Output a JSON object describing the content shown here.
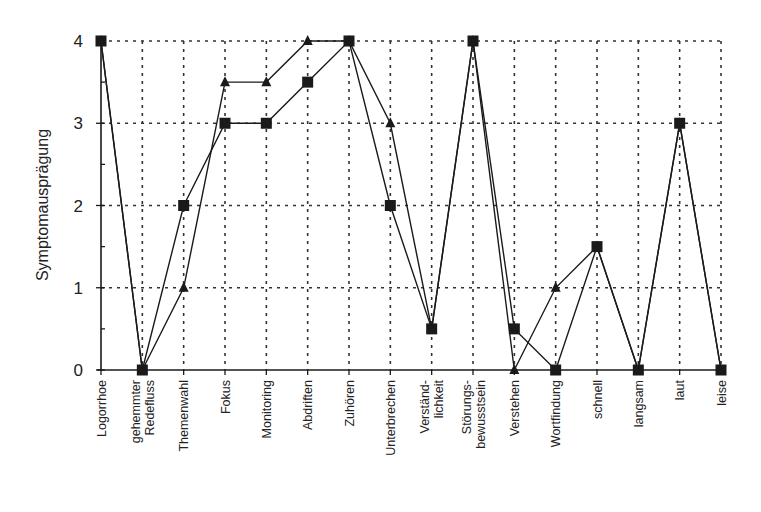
{
  "chart_data": {
    "type": "line",
    "title": "",
    "xlabel": "",
    "ylabel": "Symptomausprägung",
    "ylim": [
      0,
      4
    ],
    "yticks": [
      0,
      1,
      2,
      3,
      4
    ],
    "grid": true,
    "legend": null,
    "categories": [
      "Logorrhoe",
      "gehemmter Redefluss",
      "Themenwahl",
      "Fokus",
      "Monitoring",
      "Abdriften",
      "Zuhören",
      "Unterbrechen",
      "Verständlichkeit",
      "Störungsbewusstsein",
      "Verstehen",
      "Wortfindung",
      "schnell",
      "langsam",
      "laut",
      "leise"
    ],
    "category_label_lines": [
      [
        "Logorrhoe"
      ],
      [
        "gehemmter",
        "Redefluss"
      ],
      [
        "Themenwahl"
      ],
      [
        "Fokus"
      ],
      [
        "Monitoring"
      ],
      [
        "Abdriften"
      ],
      [
        "Zuhören"
      ],
      [
        "Unterbrechen"
      ],
      [
        "Verständ-",
        "lichkeit"
      ],
      [
        "Störungs-",
        "bewusstsein"
      ],
      [
        "Verstehen"
      ],
      [
        "Wortfindung"
      ],
      [
        "schnell"
      ],
      [
        "langsam"
      ],
      [
        "laut"
      ],
      [
        "leise"
      ]
    ],
    "series": [
      {
        "name": "Series A (square markers)",
        "marker": "square",
        "values": [
          4,
          0,
          2,
          3,
          3,
          3.5,
          4,
          2,
          0.5,
          4,
          0.5,
          0,
          1.5,
          0,
          3,
          0
        ]
      },
      {
        "name": "Series B (triangle markers)",
        "marker": "triangle",
        "values": [
          4,
          0,
          1,
          3.5,
          3.5,
          4,
          4,
          3,
          0.5,
          4,
          0,
          1,
          1.5,
          0,
          3,
          0
        ]
      }
    ]
  },
  "style": {
    "line_color": "#1a1a1a",
    "grid_color": "#333333",
    "background": "#ffffff"
  }
}
